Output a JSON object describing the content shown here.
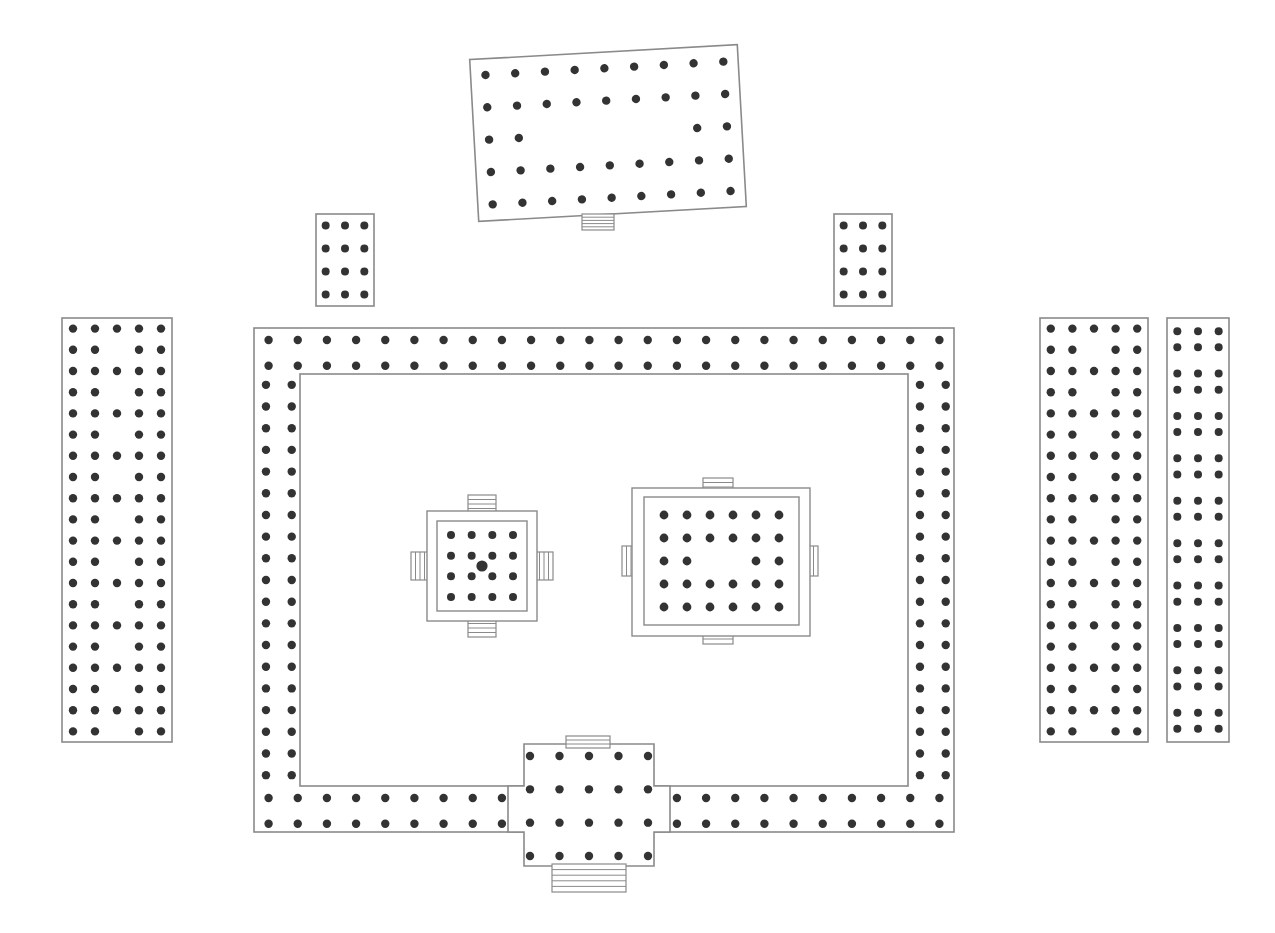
{
  "document": {
    "kind": "architectural-floor-plan",
    "title": "Temple Complex Floor Plan",
    "background_color": "#ffffff",
    "line_color": "#8a8a8a",
    "pillar_color": "#333333"
  },
  "canvas": {
    "width": 1275,
    "height": 933
  },
  "structures": {
    "top_pavilion": {
      "name": "Tilted Top Pavilion",
      "rotation_degrees": -3.2,
      "rect": {
        "x": 474,
        "y": 52,
        "width": 268,
        "height": 162
      },
      "pillar_grid": {
        "columns": 9,
        "rows": 5,
        "missing_cells": [
          [
            2,
            2
          ],
          [
            3,
            2
          ],
          [
            4,
            2
          ],
          [
            5,
            2
          ],
          [
            6,
            2
          ]
        ]
      },
      "pillar_radius": 4.2,
      "stairs": [
        {
          "side": "bottom",
          "x": 582,
          "y": 214,
          "width": 32,
          "height": 16,
          "steps": 5,
          "orientation": "horizontal"
        }
      ]
    },
    "upper_left_block": {
      "name": "Upper Left Small Block",
      "rect": {
        "x": 316,
        "y": 214,
        "width": 58,
        "height": 92
      },
      "pillar_grid": {
        "columns": 3,
        "rows": 4,
        "missing_cells": []
      },
      "pillar_radius": 4.0
    },
    "upper_right_block": {
      "name": "Upper Right Small Block",
      "rect": {
        "x": 834,
        "y": 214,
        "width": 58,
        "height": 92
      },
      "pillar_grid": {
        "columns": 3,
        "rows": 4,
        "missing_cells": []
      },
      "pillar_radius": 4.0
    },
    "left_hall": {
      "name": "Left Long Hall",
      "rect": {
        "x": 62,
        "y": 318,
        "width": 110,
        "height": 424
      },
      "pillar_grid": {
        "columns": 5,
        "rows": 20,
        "alternate_center_column": true
      },
      "pillar_radius": 4.2
    },
    "right_hall": {
      "name": "Right Long Hall",
      "rect": {
        "x": 1040,
        "y": 318,
        "width": 108,
        "height": 424
      },
      "pillar_grid": {
        "columns": 5,
        "rows": 20,
        "alternate_center_column": true
      },
      "pillar_radius": 4.2
    },
    "far_right_hall": {
      "name": "Far Right Narrow Hall",
      "rect": {
        "x": 1167,
        "y": 318,
        "width": 62,
        "height": 424
      },
      "pillar_grid": {
        "columns": 3,
        "rows": 20,
        "paired_rows": true
      },
      "pillar_radius": 4.0
    },
    "main_hall": {
      "name": "Main Hall Enclosure",
      "outer_rect": {
        "x": 254,
        "y": 328,
        "width": 700,
        "height": 504
      },
      "inner_rect": {
        "x": 300,
        "y": 374,
        "width": 608,
        "height": 412
      },
      "perimeter_pillar_rows": 2,
      "top_columns": 24,
      "side_rows": 19,
      "pillar_radius": 4.2
    },
    "entrance_porch": {
      "name": "South Entrance Porch",
      "outline_points": "524,744 654,744 654,786 670,786 670,832 654,832 654,866 524,866 524,832 508,832 508,786 524,786",
      "pillar_grid": {
        "columns": 5,
        "rows": 4
      },
      "pillar_radius": 4.2,
      "stairs": [
        {
          "side": "top",
          "x": 566,
          "y": 736,
          "width": 44,
          "height": 12,
          "steps": 3,
          "orientation": "horizontal"
        },
        {
          "side": "bottom",
          "x": 552,
          "y": 864,
          "width": 74,
          "height": 28,
          "steps": 5,
          "orientation": "horizontal"
        }
      ]
    },
    "small_shrine": {
      "name": "Small Central Shrine",
      "outer_rect": {
        "x": 427,
        "y": 511,
        "width": 110,
        "height": 110
      },
      "inner_rect": {
        "x": 437,
        "y": 521,
        "width": 90,
        "height": 90
      },
      "pillar_grid": {
        "columns": 4,
        "rows": 4
      },
      "pillar_radius": 4.0,
      "center_pillar": {
        "x": 482,
        "y": 566,
        "radius": 5.6
      },
      "stairs": [
        {
          "side": "top",
          "x": 468,
          "y": 495,
          "width": 28,
          "height": 18,
          "steps": 4,
          "orientation": "horizontal"
        },
        {
          "side": "bottom",
          "x": 468,
          "y": 619,
          "width": 28,
          "height": 18,
          "steps": 4,
          "orientation": "horizontal"
        },
        {
          "side": "left",
          "x": 411,
          "y": 552,
          "width": 18,
          "height": 28,
          "steps": 4,
          "orientation": "vertical"
        },
        {
          "side": "right",
          "x": 535,
          "y": 552,
          "width": 18,
          "height": 28,
          "steps": 4,
          "orientation": "vertical"
        }
      ]
    },
    "large_shrine": {
      "name": "Large Central Shrine",
      "outer_rect": {
        "x": 632,
        "y": 488,
        "width": 178,
        "height": 148
      },
      "inner_rect": {
        "x": 644,
        "y": 497,
        "width": 155,
        "height": 128
      },
      "pillar_grid": {
        "columns": 6,
        "rows": 5,
        "missing_cells": [
          [
            2,
            2
          ],
          [
            3,
            2
          ]
        ]
      },
      "pillar_radius": 4.4,
      "stairs": [
        {
          "side": "top",
          "x": 703,
          "y": 478,
          "width": 30,
          "height": 18,
          "steps": 4,
          "orientation": "horizontal"
        },
        {
          "side": "bottom",
          "x": 703,
          "y": 624,
          "width": 30,
          "height": 20,
          "steps": 4,
          "orientation": "horizontal"
        },
        {
          "side": "left",
          "x": 622,
          "y": 546,
          "width": 18,
          "height": 30,
          "steps": 4,
          "orientation": "vertical"
        },
        {
          "side": "right",
          "x": 800,
          "y": 546,
          "width": 18,
          "height": 30,
          "steps": 4,
          "orientation": "vertical"
        }
      ]
    }
  }
}
